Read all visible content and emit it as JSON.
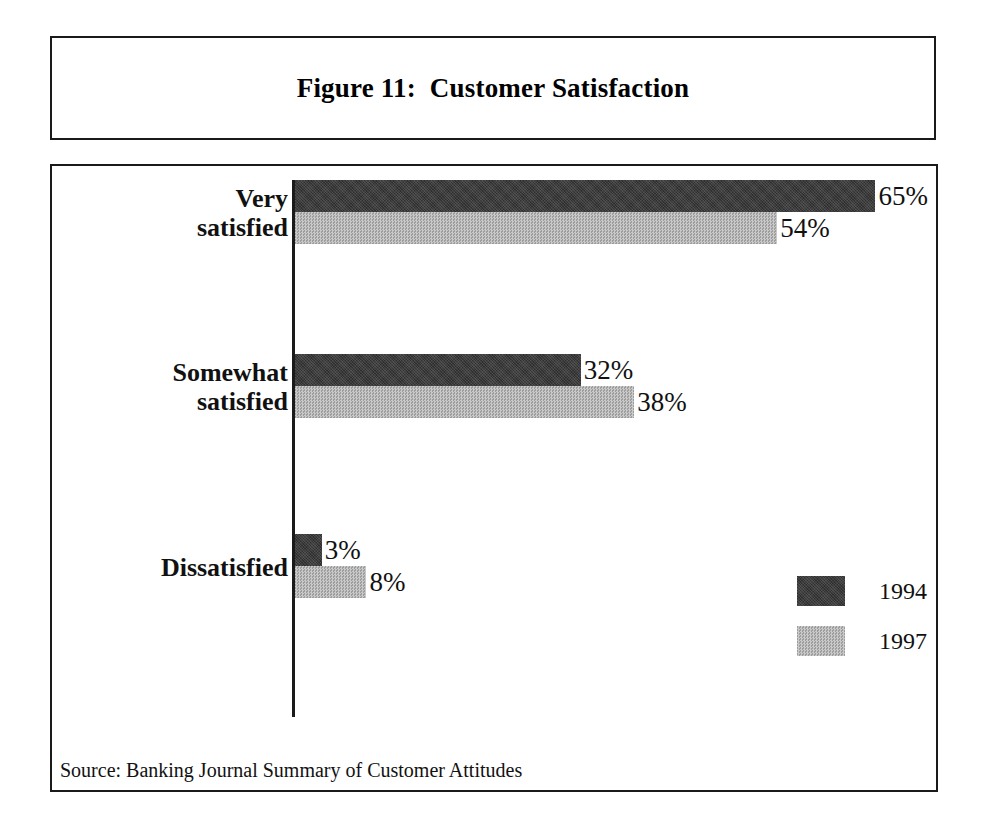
{
  "figure": {
    "title": "Figure 11:  Customer Satisfaction",
    "source_note": "Source: Banking Journal Summary of Customer Attitudes"
  },
  "legend": {
    "entries": [
      {
        "label": "1994",
        "swatch": "dark-gray-swatch",
        "color": "#3c3c3c"
      },
      {
        "label": "1997",
        "swatch": "light-gray-swatch",
        "color": "#b5b5b5"
      }
    ]
  },
  "groups": [
    {
      "label_line1": "Very",
      "label_line2": "satisfied",
      "bars": [
        {
          "series": "1994",
          "value": 65,
          "value_label": "65%"
        },
        {
          "series": "1997",
          "value": 54,
          "value_label": "54%"
        }
      ]
    },
    {
      "label_line1": "Somewhat",
      "label_line2": "satisfied",
      "bars": [
        {
          "series": "1994",
          "value": 32,
          "value_label": "32%"
        },
        {
          "series": "1997",
          "value": 38,
          "value_label": "38%"
        }
      ]
    },
    {
      "label_line1": "Dissatisfied",
      "label_line2": "",
      "bars": [
        {
          "series": "1994",
          "value": 3,
          "value_label": "3%"
        },
        {
          "series": "1997",
          "value": 8,
          "value_label": "8%"
        }
      ]
    }
  ],
  "chart_data": {
    "type": "bar",
    "orientation": "horizontal",
    "title": "Figure 11:  Customer Satisfaction",
    "xlabel": "",
    "ylabel": "",
    "categories": [
      "Very satisfied",
      "Somewhat satisfied",
      "Dissatisfied"
    ],
    "series": [
      {
        "name": "1994",
        "values": [
          65,
          32,
          3
        ],
        "color": "#3c3c3c"
      },
      {
        "name": "1997",
        "values": [
          54,
          38,
          8
        ],
        "color": "#b5b5b5"
      }
    ],
    "value_labels": [
      [
        "65%",
        "32%",
        "3%"
      ],
      [
        "54%",
        "38%",
        "8%"
      ]
    ],
    "xlim": [
      0,
      70
    ],
    "grid": false,
    "legend_position": "right-lower",
    "units": "percent",
    "source": "Source: Banking Journal Summary of Customer Attitudes"
  },
  "scale": {
    "px_per_percent": 8.93,
    "bar_height_px": 32,
    "group_tops_px": [
      14,
      188,
      368
    ]
  }
}
